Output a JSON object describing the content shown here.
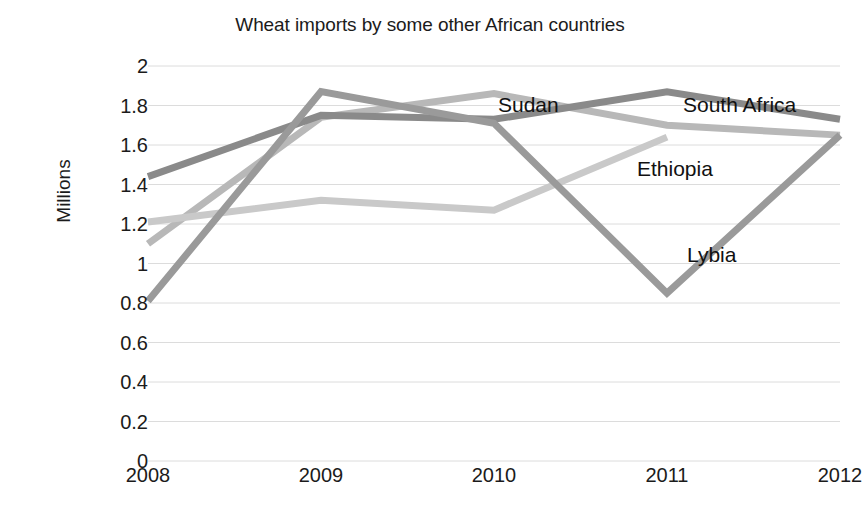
{
  "chart_data": {
    "type": "line",
    "title": "Wheat imports by some other African countries",
    "xlabel": "",
    "ylabel": "Millions",
    "categories": [
      "2008",
      "2009",
      "2010",
      "2011",
      "2012"
    ],
    "x_tick_labels": [
      "2008",
      "2009",
      "2010",
      "2011",
      "2012"
    ],
    "y_tick_labels": [
      "2",
      "1.8",
      "1.6",
      "1.4",
      "1.2",
      "1",
      "0.8",
      "0.6",
      "0.4",
      "0.2",
      "0"
    ],
    "y_tick_values": [
      2,
      1.8,
      1.6,
      1.4,
      1.2,
      1,
      0.8,
      0.6,
      0.4,
      0.2,
      0
    ],
    "ylim": [
      0,
      2
    ],
    "grid": "horizontal",
    "legend_position": "inline-labels",
    "series": [
      {
        "name": "Sudan",
        "color": "#b8b8b8",
        "values": [
          1.1,
          1.74,
          1.86,
          1.7,
          1.65
        ]
      },
      {
        "name": "South Africa",
        "color": "#8a8a8a",
        "values": [
          1.44,
          1.75,
          1.73,
          1.87,
          1.73
        ]
      },
      {
        "name": "Ethiopia",
        "color": "#c9c9c9",
        "values": [
          1.21,
          1.32,
          1.27,
          1.64,
          null
        ]
      },
      {
        "name": "Lybia",
        "color": "#9a9a9a",
        "values": [
          0.81,
          1.87,
          1.71,
          0.85,
          1.65
        ]
      }
    ],
    "annotations": [
      {
        "text": "Sudan",
        "x": 498,
        "y": 93
      },
      {
        "text": "South Africa",
        "x": 683,
        "y": 93
      },
      {
        "text": "Ethiopia",
        "x": 637,
        "y": 157
      },
      {
        "text": "Lybia",
        "x": 687,
        "y": 243
      }
    ]
  }
}
